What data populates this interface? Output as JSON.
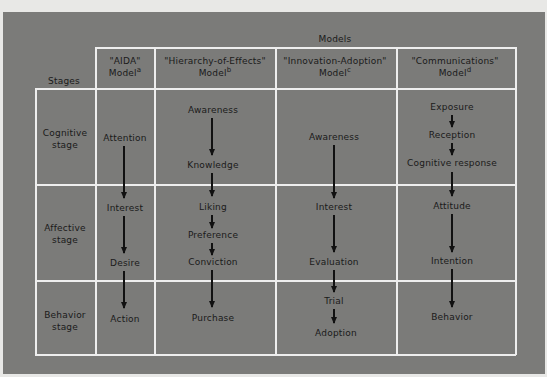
{
  "diagram": {
    "models_header": "Models",
    "stages_header": "Stages",
    "colors": {
      "background": "#7b7b79",
      "grid_lines": "#eeeeee",
      "text": "#1a1a1a",
      "arrows": "#111111",
      "page": "#e8e8e6"
    },
    "columns": [
      {
        "name": "\"AIDA\"",
        "model": "Model",
        "footnote": "a"
      },
      {
        "name": "\"Hierarchy-of-Effects\"",
        "model": "Model",
        "footnote": "b"
      },
      {
        "name": "\"Innovation-Adoption\"",
        "model": "Model",
        "footnote": "c"
      },
      {
        "name": "\"Communications\"",
        "model": "Model",
        "footnote": "d"
      }
    ],
    "stages": [
      {
        "line1": "Cognitive",
        "line2": "stage"
      },
      {
        "line1": "Affective",
        "line2": "stage"
      },
      {
        "line1": "Behavior",
        "line2": "stage"
      }
    ],
    "aida": [
      "Attention",
      "Interest",
      "Desire",
      "Action"
    ],
    "hierarchy": [
      "Awareness",
      "Knowledge",
      "Liking",
      "Preference",
      "Conviction",
      "Purchase"
    ],
    "innovation": [
      "Awareness",
      "Interest",
      "Evaluation",
      "Trial",
      "Adoption"
    ],
    "communications": [
      "Exposure",
      "Reception",
      "Cognitive response",
      "Attitude",
      "Intention",
      "Behavior"
    ]
  }
}
